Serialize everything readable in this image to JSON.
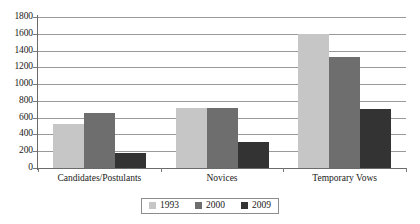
{
  "chart_data": {
    "type": "bar",
    "title": "",
    "subtitle": "",
    "xlabel": "",
    "ylabel": "",
    "categories": [
      "Candidates/Postulants",
      "Novices",
      "Temporary Vows"
    ],
    "series": [
      {
        "name": "1993",
        "color": "#c6c6c6",
        "values": [
          520,
          710,
          1600
        ]
      },
      {
        "name": "2000",
        "color": "#6e6e6e",
        "values": [
          660,
          715,
          1320
        ]
      },
      {
        "name": "2009",
        "color": "#333333",
        "values": [
          175,
          310,
          700
        ]
      }
    ],
    "ylim": [
      0,
      1800
    ],
    "ytick_step": 200,
    "yticks": [
      0,
      200,
      400,
      600,
      800,
      1000,
      1200,
      1400,
      1600,
      1800
    ],
    "ytick_labels": [
      "0",
      "200",
      "400",
      "600",
      "800",
      "1000",
      "1200",
      "1400",
      "1600",
      "1800"
    ],
    "grid": true,
    "grid_axis": "y",
    "legend_position": "bottom-center",
    "legend_border": true,
    "axis_color": "#6b6b6b",
    "grid_color": "#9a9a9a",
    "background": "#ffffff"
  }
}
